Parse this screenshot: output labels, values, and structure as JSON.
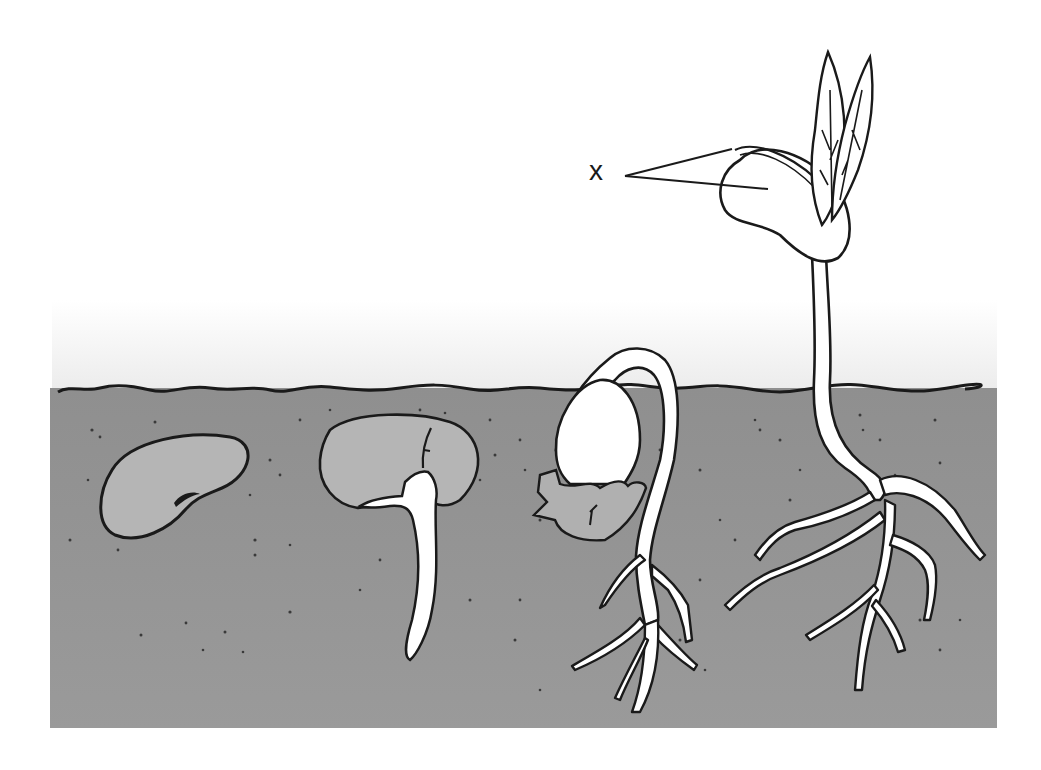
{
  "diagram": {
    "label": "x",
    "stages": [
      {
        "id": "stage-1",
        "description": "dry seed in soil"
      },
      {
        "id": "stage-2",
        "description": "seed with emerging radicle"
      },
      {
        "id": "stage-3",
        "description": "hypocotyl hook emerging with roots"
      },
      {
        "id": "stage-4",
        "description": "seedling with cotyledons, first leaves and branched roots"
      }
    ],
    "colors": {
      "soil": "#8c8c8c",
      "seed": "#b4b4b4",
      "plant": "#ffffff",
      "outline": "#1a1a1a",
      "sky": "#f2f2f2"
    }
  }
}
